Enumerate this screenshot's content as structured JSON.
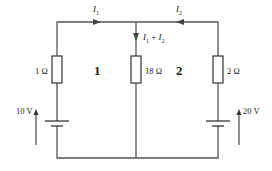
{
  "diagram": {
    "type": "circuit",
    "title": "",
    "colors": {
      "wire": "#555555",
      "component": "#333333",
      "text": "#222222",
      "background": "#ffffff"
    },
    "currents": {
      "i1": {
        "symbol": "I",
        "sub": "1",
        "direction": "right"
      },
      "i2": {
        "symbol": "I",
        "sub": "2",
        "direction": "left"
      },
      "i_sum": {
        "a": "I",
        "a_sub": "1",
        "plus": " + ",
        "b": "I",
        "b_sub": "2",
        "direction": "down"
      }
    },
    "resistors": {
      "left": "1 Ω",
      "middle": "18 Ω",
      "right": "2 Ω"
    },
    "batteries": {
      "left": "10 V",
      "right": "20 V"
    },
    "loops": {
      "left": "1",
      "right": "2"
    }
  }
}
